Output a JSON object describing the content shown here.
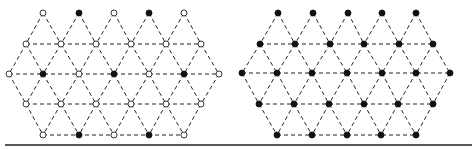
{
  "figure": {
    "colors": {
      "line": "#222222",
      "filled": "#111111",
      "open": "#ffffff"
    },
    "baseline": {
      "x1": 5,
      "x2": 472,
      "y": 145
    },
    "lattices": [
      {
        "name": "left-lattice",
        "rows": [
          {
            "y": 13,
            "nodes": [
              [
                43,
                "open"
              ],
              [
                79,
                "filled"
              ],
              [
                114,
                "open"
              ],
              [
                149,
                "filled"
              ],
              [
                184,
                "open"
              ]
            ]
          },
          {
            "y": 44,
            "nodes": [
              [
                26,
                "open"
              ],
              [
                61,
                "open"
              ],
              [
                96,
                "open"
              ],
              [
                131,
                "open"
              ],
              [
                166,
                "open"
              ],
              [
                201,
                "open"
              ]
            ]
          },
          {
            "y": 74,
            "nodes": [
              [
                9,
                "open"
              ],
              [
                43,
                "filled"
              ],
              [
                79,
                "open"
              ],
              [
                114,
                "filled"
              ],
              [
                149,
                "open"
              ],
              [
                184,
                "filled"
              ],
              [
                219,
                "open"
              ]
            ]
          },
          {
            "y": 104,
            "nodes": [
              [
                26,
                "open"
              ],
              [
                61,
                "open"
              ],
              [
                96,
                "open"
              ],
              [
                131,
                "open"
              ],
              [
                166,
                "open"
              ],
              [
                201,
                "open"
              ]
            ]
          },
          {
            "y": 135,
            "nodes": [
              [
                43,
                "open"
              ],
              [
                79,
                "filled"
              ],
              [
                114,
                "open"
              ],
              [
                149,
                "filled"
              ],
              [
                184,
                "open"
              ]
            ]
          }
        ]
      },
      {
        "name": "right-lattice",
        "rows": [
          {
            "y": 13,
            "nodes": [
              [
                278,
                "filled"
              ],
              [
                313,
                "filled"
              ],
              [
                348,
                "filled"
              ],
              [
                382,
                "filled"
              ],
              [
                416,
                "filled"
              ]
            ]
          },
          {
            "y": 44,
            "nodes": [
              [
                260,
                "filled"
              ],
              [
                295,
                "filled"
              ],
              [
                330,
                "filled"
              ],
              [
                364,
                "filled"
              ],
              [
                399,
                "filled"
              ],
              [
                433,
                "filled"
              ]
            ]
          },
          {
            "y": 73,
            "nodes": [
              [
                242,
                "filled"
              ],
              [
                277,
                "filled"
              ],
              [
                312,
                "filled"
              ],
              [
                347,
                "filled"
              ],
              [
                382,
                "filled"
              ],
              [
                416,
                "filled"
              ],
              [
                450,
                "filled"
              ]
            ]
          },
          {
            "y": 104,
            "nodes": [
              [
                259,
                "filled"
              ],
              [
                294,
                "filled"
              ],
              [
                329,
                "filled"
              ],
              [
                364,
                "filled"
              ],
              [
                398,
                "filled"
              ],
              [
                433,
                "filled"
              ]
            ]
          },
          {
            "y": 135,
            "nodes": [
              [
                277,
                "filled"
              ],
              [
                312,
                "filled"
              ],
              [
                347,
                "filled"
              ],
              [
                381,
                "filled"
              ],
              [
                416,
                "filled"
              ]
            ]
          }
        ]
      }
    ]
  }
}
